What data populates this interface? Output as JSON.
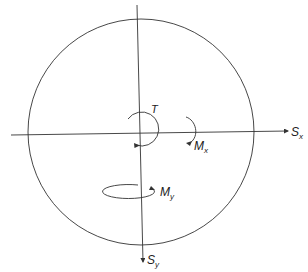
{
  "diagram": {
    "colors": {
      "stroke": "#333333",
      "background": "#ffffff"
    },
    "circle": {
      "cx": 141,
      "cy": 132,
      "r": 113
    },
    "axes": {
      "x": {
        "label_main": "S",
        "label_sub": "x"
      },
      "y": {
        "label_main": "S",
        "label_sub": "y"
      }
    },
    "moments": {
      "torque": {
        "label_main": "T",
        "label_sub": ""
      },
      "mx": {
        "label_main": "M",
        "label_sub": "x"
      },
      "my": {
        "label_main": "M",
        "label_sub": "y"
      }
    }
  }
}
